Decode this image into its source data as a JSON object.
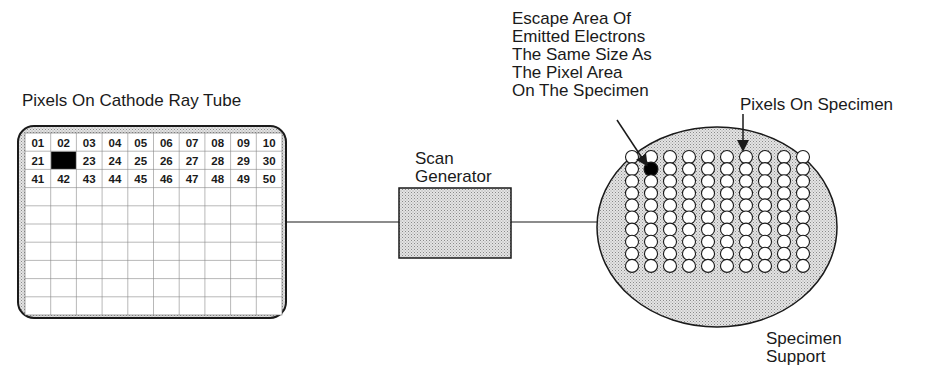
{
  "labels": {
    "crt_title": "Pixels On Cathode Ray Tube",
    "scan_generator": "Scan\nGenerator",
    "escape_area": "Escape Area Of\nEmitted Electrons\nThe Same Size As\nThe Pixel Area\nOn The Specimen",
    "pixels_on_specimen": "Pixels On Specimen",
    "specimen_support": "Specimen\nSupport"
  },
  "crt_grid": {
    "columns": 10,
    "rows": 10,
    "highlighted_cell": "22",
    "numbered_rows": [
      [
        "01",
        "02",
        "03",
        "04",
        "05",
        "06",
        "07",
        "08",
        "09",
        "10"
      ],
      [
        "21",
        "",
        "23",
        "24",
        "25",
        "26",
        "27",
        "28",
        "29",
        "30"
      ],
      [
        "41",
        "42",
        "43",
        "44",
        "45",
        "46",
        "47",
        "48",
        "49",
        "50"
      ]
    ]
  },
  "specimen_grid": {
    "columns": 10,
    "rows": 10,
    "filled_pixel": {
      "row": 1,
      "col": 1
    }
  },
  "colors": {
    "stroke": "#1a1a1a",
    "stipple": "#c8c8c8",
    "background": "#ffffff"
  }
}
